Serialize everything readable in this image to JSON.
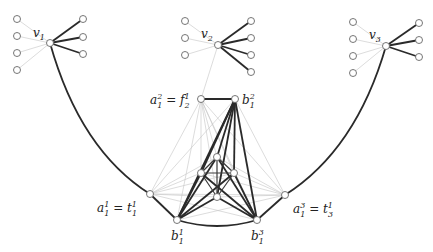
{
  "diagram": {
    "type": "graph",
    "colors": {
      "thick_edge": "#2a2a2a",
      "thin_edge": "#c4c4c4",
      "node_fill": "#ffffff",
      "node_stroke": "#666666"
    },
    "labels": {
      "v1": {
        "base": "v",
        "sub": "1"
      },
      "v2": {
        "base": "v",
        "sub": "2"
      },
      "v3": {
        "base": "v",
        "sub": "3"
      },
      "a12": {
        "left_base": "a",
        "left_sub": "1",
        "left_sup": "2",
        "eq": " = ",
        "right_base": "f",
        "right_sub": "2",
        "right_sup": "1"
      },
      "b12": {
        "base": "b",
        "sub": "1",
        "sup": "2"
      },
      "a11": {
        "left_base": "a",
        "left_sub": "1",
        "left_sup": "1",
        "eq": " = ",
        "right_base": "t",
        "right_sub": "1",
        "right_sup": "1"
      },
      "a13": {
        "left_base": "a",
        "left_sub": "1",
        "left_sup": "3",
        "eq": " = ",
        "right_base": "t",
        "right_sub": "3",
        "right_sup": "1"
      },
      "b11": {
        "base": "b",
        "sub": "1",
        "sup": "1"
      },
      "b13": {
        "base": "b",
        "sub": "1",
        "sup": "3"
      }
    }
  }
}
